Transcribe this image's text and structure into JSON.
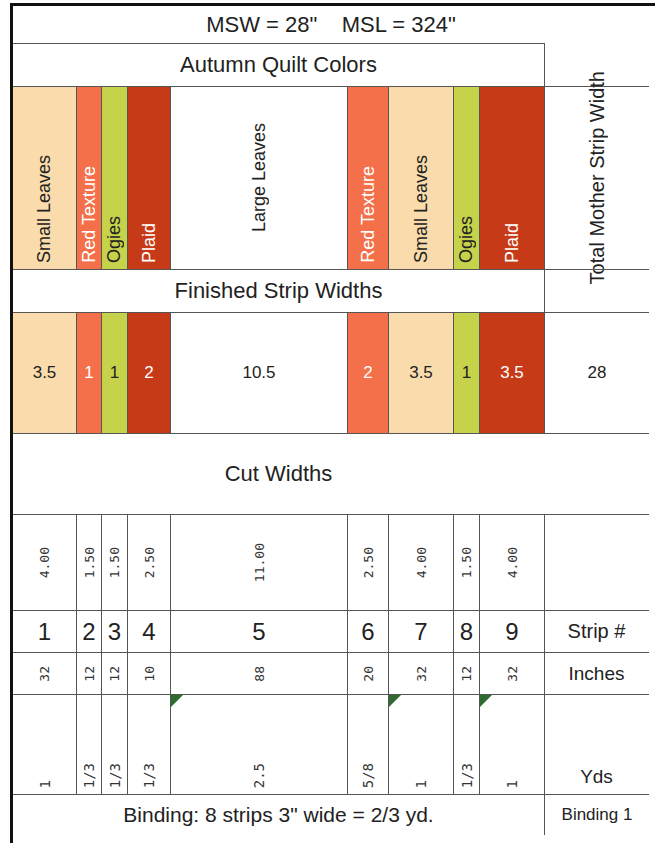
{
  "header": {
    "title": "MSW = 28\"    MSL = 324\"",
    "subtitle": "Autumn Quilt Colors"
  },
  "colors": {
    "small_leaves": "#fadcac",
    "red_texture": "#f4704a",
    "ogies": "#c5d24a",
    "plaid": "#c73a18",
    "large_leaves": "#ffffff",
    "comment_marker": "#2e6b2e"
  },
  "strips": [
    {
      "number": "1",
      "fabric": "Small Leaves",
      "color": "small_leaves",
      "finished": "3.5",
      "cut": "4.00",
      "inches": "32",
      "yds": "1",
      "light_text": false,
      "comment": false
    },
    {
      "number": "2",
      "fabric": "Red Texture",
      "color": "red_texture",
      "finished": "1",
      "cut": "1.50",
      "inches": "12",
      "yds": "1/3",
      "light_text": true,
      "comment": false
    },
    {
      "number": "3",
      "fabric": "Ogies",
      "color": "ogies",
      "finished": "1",
      "cut": "1.50",
      "inches": "12",
      "yds": "1/3",
      "light_text": false,
      "comment": false
    },
    {
      "number": "4",
      "fabric": "Plaid",
      "color": "plaid",
      "finished": "2",
      "cut": "2.50",
      "inches": "10",
      "yds": "1/3",
      "light_text": true,
      "comment": false
    },
    {
      "number": "5",
      "fabric": "Large Leaves",
      "color": "large_leaves",
      "finished": "10.5",
      "cut": "11.00",
      "inches": "88",
      "yds": "2.5",
      "light_text": false,
      "comment": true
    },
    {
      "number": "6",
      "fabric": "Red Texture",
      "color": "red_texture",
      "finished": "2",
      "cut": "2.50",
      "inches": "20",
      "yds": "5/8",
      "light_text": true,
      "comment": false
    },
    {
      "number": "7",
      "fabric": "Small Leaves",
      "color": "small_leaves",
      "finished": "3.5",
      "cut": "4.00",
      "inches": "32",
      "yds": "1",
      "light_text": false,
      "comment": true
    },
    {
      "number": "8",
      "fabric": "Ogies",
      "color": "ogies",
      "finished": "1",
      "cut": "1.50",
      "inches": "12",
      "yds": "1/3",
      "light_text": false,
      "comment": false
    },
    {
      "number": "9",
      "fabric": "Plaid",
      "color": "plaid",
      "finished": "3.5",
      "cut": "4.00",
      "inches": "32",
      "yds": "1",
      "light_text": true,
      "comment": true
    }
  ],
  "sections": {
    "finished_title": "Finished Strip Widths",
    "cut_title": "Cut Widths"
  },
  "summary_column": {
    "header": "Total Mother Strip Width",
    "total": "28",
    "strip_label": "Strip #",
    "inches_label": "Inches",
    "yds_label": "Yds",
    "binding_label": "Binding 1"
  },
  "binding": {
    "text": "Binding: 8 strips 3\" wide = 2/3 yd."
  }
}
